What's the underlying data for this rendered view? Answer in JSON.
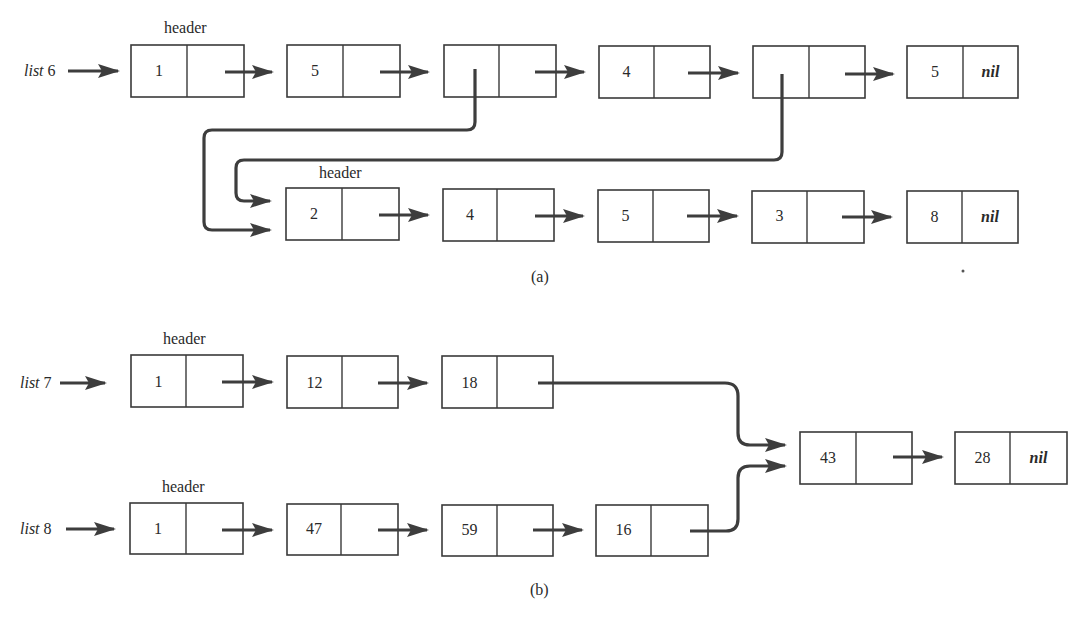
{
  "figure": {
    "part_a": {
      "caption": "(a)",
      "list6": {
        "label_name": "list",
        "label_num": "6",
        "header_label": "header",
        "nodes": [
          {
            "value": "1",
            "next": ""
          },
          {
            "value": "5",
            "next": ""
          },
          {
            "value": "",
            "next": "",
            "points_to": "list header (2)"
          },
          {
            "value": "4",
            "next": ""
          },
          {
            "value": "",
            "next": "",
            "points_to": "list header (2)"
          },
          {
            "value": "5",
            "next": "nil"
          }
        ]
      },
      "sublist": {
        "header_label": "header",
        "nodes": [
          {
            "value": "2",
            "next": ""
          },
          {
            "value": "4",
            "next": ""
          },
          {
            "value": "5",
            "next": ""
          },
          {
            "value": "3",
            "next": ""
          },
          {
            "value": "8",
            "next": "nil"
          }
        ]
      }
    },
    "part_b": {
      "caption": "(b)",
      "list7": {
        "label_name": "list",
        "label_num": "7",
        "header_label": "header",
        "nodes": [
          {
            "value": "1",
            "next": ""
          },
          {
            "value": "12",
            "next": ""
          },
          {
            "value": "18",
            "next": ""
          }
        ]
      },
      "list8": {
        "label_name": "list",
        "label_num": "8",
        "header_label": "header",
        "nodes": [
          {
            "value": "1",
            "next": ""
          },
          {
            "value": "47",
            "next": ""
          },
          {
            "value": "59",
            "next": ""
          },
          {
            "value": "16",
            "next": ""
          }
        ]
      },
      "shared": {
        "nodes": [
          {
            "value": "43",
            "next": ""
          },
          {
            "value": "28",
            "next": "nil"
          }
        ]
      }
    }
  }
}
